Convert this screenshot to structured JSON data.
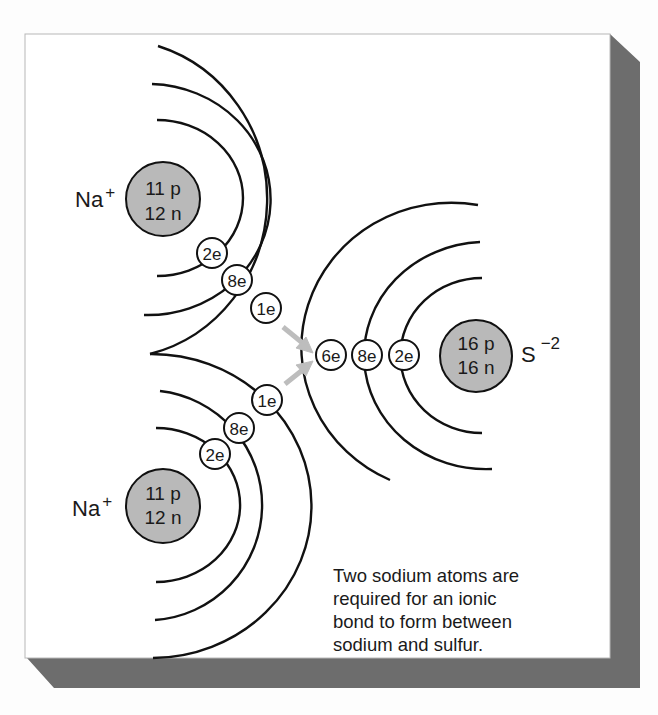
{
  "figure": {
    "colors": {
      "panel": "#ffffff",
      "panel_border": "#b8b8b8",
      "shadow": "#6d6d6d",
      "nucleus_fill": "#b9b9b9",
      "line": "#111111",
      "arrow": "#bdbdbd"
    },
    "atoms": {
      "na_top": {
        "ion_symbol": "Na",
        "charge": "+",
        "nucleus": {
          "protons": "11 p",
          "neutrons": "12 n"
        },
        "shells": [
          {
            "label": "2e"
          },
          {
            "label": "8e"
          },
          {
            "label": "1e"
          }
        ]
      },
      "na_bottom": {
        "ion_symbol": "Na",
        "charge": "+",
        "nucleus": {
          "protons": "11 p",
          "neutrons": "12 n"
        },
        "shells": [
          {
            "label": "2e"
          },
          {
            "label": "8e"
          },
          {
            "label": "1e"
          }
        ]
      },
      "sulfur": {
        "ion_symbol": "S",
        "charge": "−2",
        "nucleus": {
          "protons": "16 p",
          "neutrons": "16 n"
        },
        "shells": [
          {
            "label": "2e"
          },
          {
            "label": "8e"
          },
          {
            "label": "6e"
          }
        ]
      }
    },
    "arrows": [
      {
        "from": "na_top.1e",
        "to": "sulfur.6e"
      },
      {
        "from": "na_bottom.1e",
        "to": "sulfur.6e"
      }
    ],
    "caption": {
      "lines": [
        "Two sodium atoms are",
        "required for an ionic",
        "bond to form between",
        "sodium and sulfur."
      ]
    }
  }
}
